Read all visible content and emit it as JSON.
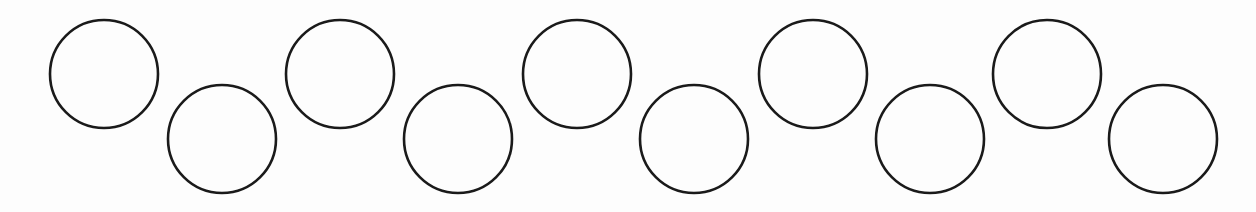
{
  "figure": {
    "circle_count": 10,
    "pattern": [
      "upper",
      "lower",
      "upper",
      "lower",
      "upper",
      "lower",
      "upper",
      "lower",
      "upper",
      "lower"
    ],
    "stroke_color": "#1a1a1a",
    "fill_color": "none",
    "background_color": "#fdfdfd"
  }
}
